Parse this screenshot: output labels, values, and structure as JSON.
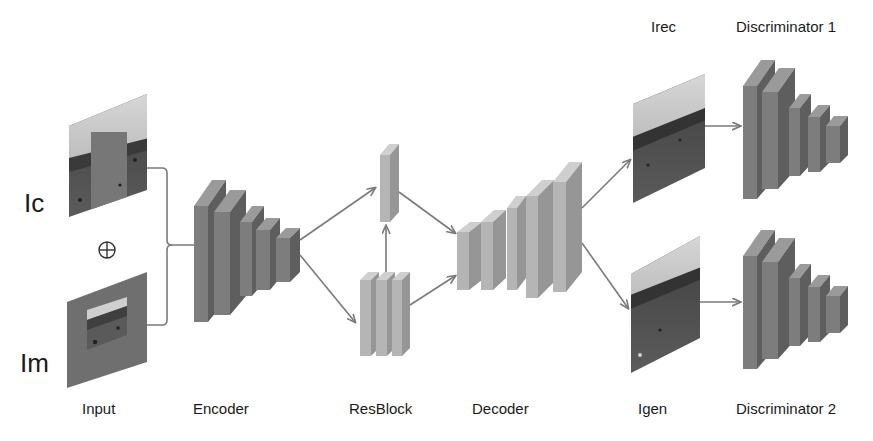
{
  "diagram": {
    "inputs": {
      "ic_label": "Ic",
      "im_label": "Im",
      "combine_symbol": "⊕",
      "caption": "Input"
    },
    "stages": {
      "encoder": "Encoder",
      "resblock": "ResBlock",
      "decoder": "Decoder"
    },
    "outputs": {
      "irec_label": "Irec",
      "igen_label": "Igen"
    },
    "discriminators": {
      "d1_label": "Discriminator 1",
      "d2_label": "Discriminator 2"
    },
    "colors": {
      "dark_block_front": "#7d7d7d",
      "dark_block_side": "#5e5e5e",
      "dark_block_top": "#9a9a9a",
      "light_block_front": "#b5b5b5",
      "light_block_side": "#969696",
      "light_block_top": "#cfcfcf",
      "arrow": "#7a7a7a",
      "sky": "#c9c9c9",
      "ground_dark": "#4a4a4a",
      "mask_grey": "#777777"
    },
    "layers": {
      "encoder_blocks": 5,
      "resblock_top_blocks": 1,
      "resblock_bottom_blocks": 3,
      "decoder_blocks": 5,
      "discriminator_blocks": 5
    }
  }
}
